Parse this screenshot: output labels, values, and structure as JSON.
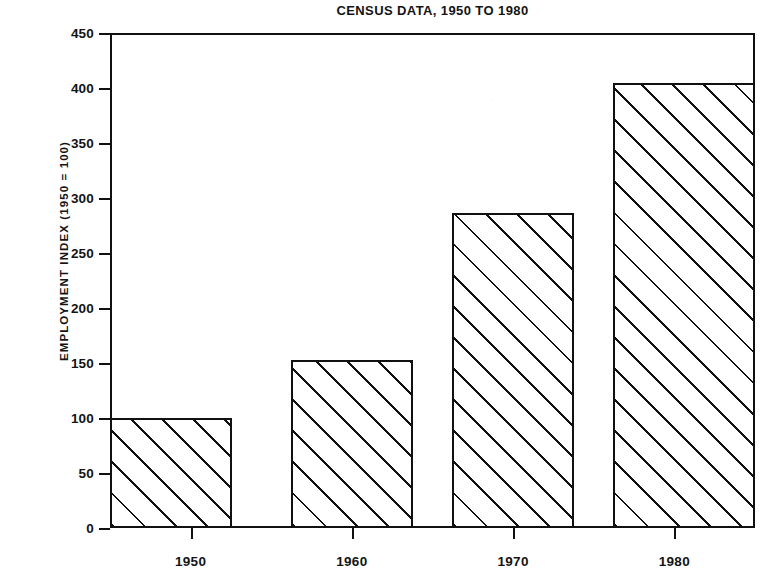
{
  "chart_data": {
    "type": "bar",
    "title": "CENSUS DATA, 1950 TO 1980",
    "xlabel": "",
    "ylabel": "EMPLOYMENT INDEX (1950 = 100)",
    "categories": [
      "1950",
      "1960",
      "1970",
      "1980"
    ],
    "values": [
      100,
      153,
      286,
      405
    ],
    "ylim": [
      0,
      450
    ],
    "yticks": [
      0,
      50,
      100,
      150,
      200,
      250,
      300,
      350,
      400,
      450
    ],
    "ytick_labels": [
      "0",
      "50",
      "100",
      "150",
      "200",
      "250",
      "300",
      "350",
      "400",
      "450"
    ],
    "grid": false,
    "legend": null,
    "legend_position": "none",
    "series": [
      {
        "name": "Employment index",
        "values": [
          100,
          153,
          286,
          405
        ]
      }
    ],
    "style": {
      "bar_fill": "hatch-45",
      "bar_edge_color": "#111111",
      "background": "#ffffff",
      "frame": "box"
    }
  }
}
